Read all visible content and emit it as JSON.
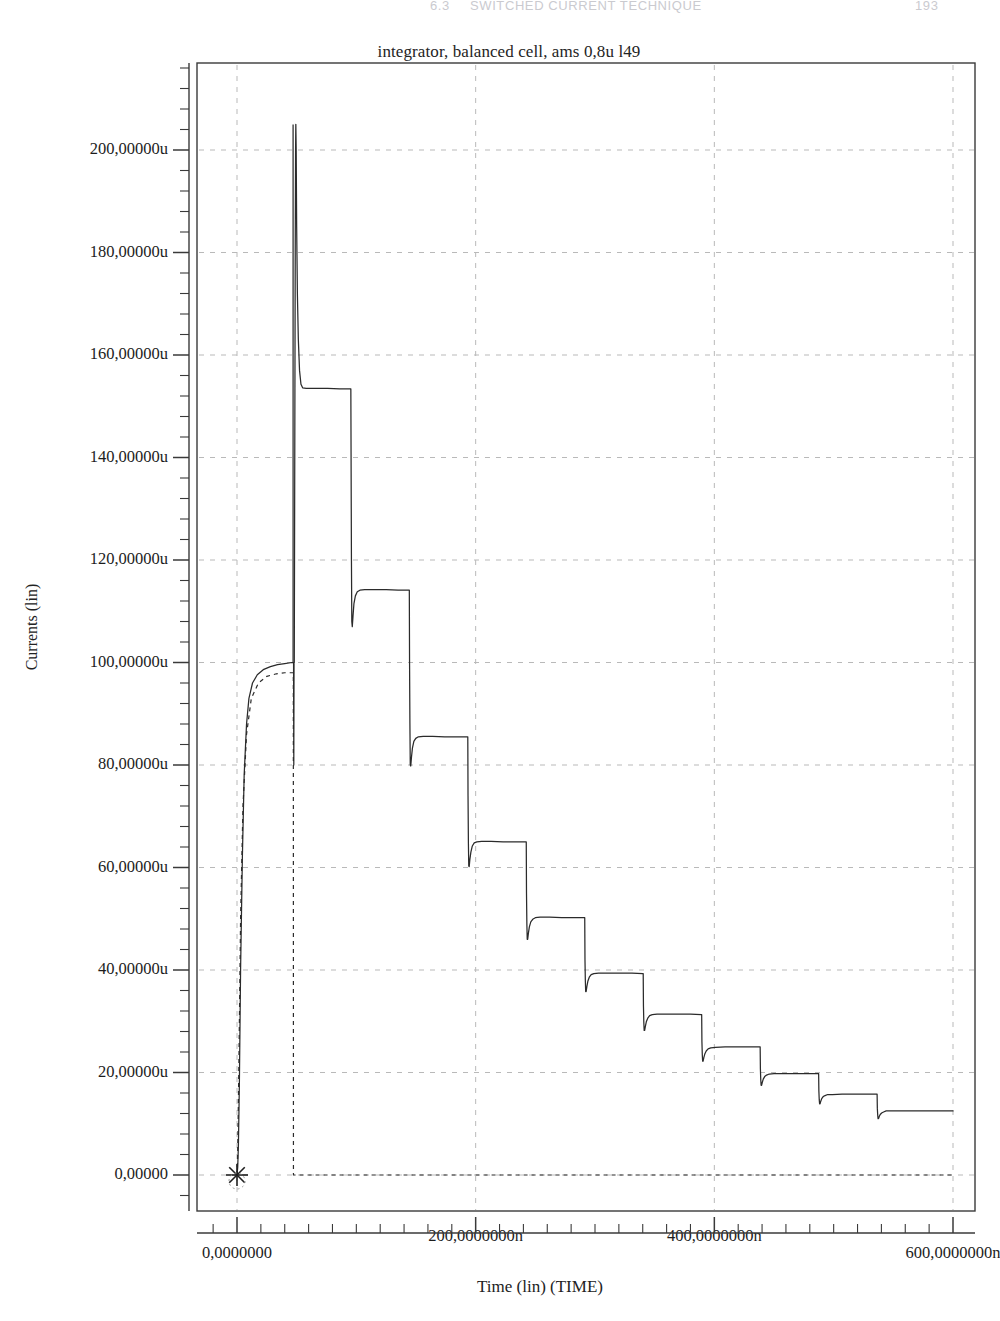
{
  "page_header": {
    "section": "6.3",
    "title": "SWITCHED CURRENT TECHNIQUE",
    "page_number": "193"
  },
  "chart_data": {
    "type": "line",
    "title": "integrator, balanced cell,  ams 0,8u l49",
    "xlabel": "Time (lin) (TIME)",
    "ylabel": "Currents (lin)",
    "xlim": [
      -18,
      640
    ],
    "ylim": [
      -12,
      228
    ],
    "x_unit": "n",
    "y_unit": "u",
    "grid": "dashed-major",
    "legend": "none",
    "x_ticks": [
      {
        "value": 0,
        "label": "0,0000000"
      },
      {
        "value": 200,
        "label": "200,0000000n"
      },
      {
        "value": 400,
        "label": "400,0000000n"
      },
      {
        "value": 600,
        "label": "600,0000000n"
      }
    ],
    "x_minor_step": 20,
    "y_ticks": [
      {
        "value": 0,
        "label": "0,00000"
      },
      {
        "value": 20,
        "label": "20,00000u"
      },
      {
        "value": 40,
        "label": "40,00000u"
      },
      {
        "value": 60,
        "label": "60,00000u"
      },
      {
        "value": 80,
        "label": "80,00000u"
      },
      {
        "value": 100,
        "label": "100,00000u"
      },
      {
        "value": 120,
        "label": "120,00000u"
      },
      {
        "value": 140,
        "label": "140,00000u"
      },
      {
        "value": 160,
        "label": "160,00000u"
      },
      {
        "value": 180,
        "label": "180,00000u"
      },
      {
        "value": 200,
        "label": "200,00000u"
      }
    ],
    "y_minor_step": 4,
    "origin_marker": {
      "x": 0,
      "y": 0,
      "symbol": "asterisk"
    },
    "series": [
      {
        "name": "current-solid",
        "style": "solid",
        "color": "#2b2b2b",
        "points": [
          [
            0,
            0
          ],
          [
            0.6,
            1.5
          ],
          [
            1.2,
            6
          ],
          [
            2,
            18
          ],
          [
            3,
            40
          ],
          [
            4.5,
            62
          ],
          [
            6,
            78
          ],
          [
            8,
            88
          ],
          [
            10,
            93
          ],
          [
            13,
            96
          ],
          [
            17,
            97.6
          ],
          [
            22,
            98.6
          ],
          [
            28,
            99.2
          ],
          [
            34,
            99.6
          ],
          [
            40,
            99.8
          ],
          [
            46,
            100
          ],
          [
            47,
            100
          ],
          [
            47.2,
            100
          ],
          [
            47.4,
            100
          ],
          [
            47.6,
            80
          ],
          [
            47.8,
            100
          ],
          [
            48,
            100
          ],
          [
            48.4,
            140
          ],
          [
            48.8,
            180
          ],
          [
            49.1,
            200
          ],
          [
            49.3,
            205
          ],
          [
            49.6,
            200
          ],
          [
            50,
            185
          ],
          [
            50.6,
            172
          ],
          [
            51.4,
            163
          ],
          [
            52.4,
            157
          ],
          [
            53.6,
            154.3
          ],
          [
            55,
            153.6
          ],
          [
            58,
            153.5
          ],
          [
            66,
            153.5
          ],
          [
            76,
            153.5
          ],
          [
            86,
            153.4
          ],
          [
            95,
            153.4
          ],
          [
            95.4,
            153.4
          ],
          [
            95.6,
            140
          ],
          [
            95.9,
            120
          ],
          [
            96.2,
            108
          ],
          [
            96.6,
            107
          ],
          [
            97.2,
            109
          ],
          [
            98,
            111.5
          ],
          [
            99.2,
            113
          ],
          [
            100.8,
            113.8
          ],
          [
            103,
            114.1
          ],
          [
            107,
            114.2
          ],
          [
            115,
            114.2
          ],
          [
            125,
            114.2
          ],
          [
            135,
            114.1
          ],
          [
            144,
            114.1
          ],
          [
            144.4,
            114.1
          ],
          [
            144.6,
            100
          ],
          [
            144.9,
            88
          ],
          [
            145.2,
            80
          ],
          [
            145.6,
            79.8
          ],
          [
            146.2,
            81.5
          ],
          [
            147,
            83.3
          ],
          [
            148.2,
            84.6
          ],
          [
            149.8,
            85.2
          ],
          [
            152,
            85.5
          ],
          [
            156,
            85.6
          ],
          [
            164,
            85.6
          ],
          [
            174,
            85.5
          ],
          [
            184,
            85.5
          ],
          [
            193,
            85.5
          ],
          [
            193.4,
            85.5
          ],
          [
            193.6,
            74
          ],
          [
            193.9,
            65
          ],
          [
            194.2,
            60.3
          ],
          [
            194.6,
            60.2
          ],
          [
            195.2,
            61.7
          ],
          [
            196,
            63
          ],
          [
            197.2,
            64.2
          ],
          [
            198.8,
            64.8
          ],
          [
            201,
            65
          ],
          [
            205,
            65.1
          ],
          [
            213,
            65.1
          ],
          [
            223,
            65
          ],
          [
            233,
            65
          ],
          [
            242,
            65
          ],
          [
            242.4,
            65
          ],
          [
            242.6,
            55
          ],
          [
            242.9,
            49
          ],
          [
            243.2,
            46
          ],
          [
            243.6,
            46
          ],
          [
            244.2,
            47.2
          ],
          [
            245,
            48.4
          ],
          [
            246.2,
            49.4
          ],
          [
            247.8,
            49.9
          ],
          [
            250,
            50.2
          ],
          [
            254,
            50.3
          ],
          [
            262,
            50.3
          ],
          [
            272,
            50.2
          ],
          [
            282,
            50.2
          ],
          [
            291,
            50.2
          ],
          [
            291.4,
            50.2
          ],
          [
            291.6,
            42
          ],
          [
            291.9,
            38
          ],
          [
            292.2,
            35.8
          ],
          [
            292.6,
            35.8
          ],
          [
            293.2,
            36.8
          ],
          [
            294,
            37.8
          ],
          [
            295.2,
            38.6
          ],
          [
            296.8,
            39.1
          ],
          [
            299,
            39.3
          ],
          [
            303,
            39.4
          ],
          [
            311,
            39.4
          ],
          [
            321,
            39.4
          ],
          [
            331,
            39.4
          ],
          [
            340,
            39.3
          ],
          [
            340.4,
            39.3
          ],
          [
            340.6,
            33
          ],
          [
            340.9,
            29.8
          ],
          [
            341.2,
            28.2
          ],
          [
            341.6,
            28.2
          ],
          [
            342.2,
            29
          ],
          [
            343,
            29.9
          ],
          [
            344.2,
            30.6
          ],
          [
            345.8,
            31.1
          ],
          [
            348,
            31.3
          ],
          [
            352,
            31.4
          ],
          [
            360,
            31.4
          ],
          [
            370,
            31.4
          ],
          [
            380,
            31.4
          ],
          [
            389,
            31.3
          ],
          [
            389.4,
            31.3
          ],
          [
            389.6,
            26
          ],
          [
            389.9,
            23.5
          ],
          [
            390.2,
            22.2
          ],
          [
            390.6,
            22.2
          ],
          [
            391.2,
            22.9
          ],
          [
            392,
            23.6
          ],
          [
            393.2,
            24.2
          ],
          [
            394.8,
            24.6
          ],
          [
            397,
            24.8
          ],
          [
            401,
            24.9
          ],
          [
            409,
            25
          ],
          [
            419,
            25
          ],
          [
            429,
            25
          ],
          [
            438,
            25
          ],
          [
            438.4,
            25
          ],
          [
            438.6,
            20.7
          ],
          [
            438.9,
            18.6
          ],
          [
            439.2,
            17.5
          ],
          [
            439.6,
            17.5
          ],
          [
            440.2,
            18.1
          ],
          [
            441,
            18.7
          ],
          [
            442.2,
            19.2
          ],
          [
            443.8,
            19.5
          ],
          [
            446,
            19.7
          ],
          [
            450,
            19.8
          ],
          [
            458,
            19.8
          ],
          [
            468,
            19.8
          ],
          [
            478,
            19.8
          ],
          [
            487,
            19.8
          ],
          [
            487.4,
            19.8
          ],
          [
            487.6,
            16.4
          ],
          [
            487.9,
            14.7
          ],
          [
            488.2,
            13.9
          ],
          [
            488.6,
            13.9
          ],
          [
            489.2,
            14.4
          ],
          [
            490,
            14.9
          ],
          [
            491.2,
            15.3
          ],
          [
            492.8,
            15.5
          ],
          [
            495,
            15.7
          ],
          [
            499,
            15.7
          ],
          [
            507,
            15.8
          ],
          [
            517,
            15.8
          ],
          [
            527,
            15.8
          ],
          [
            536,
            15.8
          ],
          [
            536.4,
            15.8
          ],
          [
            536.6,
            13
          ],
          [
            536.9,
            11.7
          ],
          [
            537.2,
            11
          ],
          [
            537.6,
            11
          ],
          [
            538.2,
            11.4
          ],
          [
            539,
            11.8
          ],
          [
            540.2,
            12.1
          ],
          [
            541.8,
            12.3
          ],
          [
            544,
            12.5
          ],
          [
            548,
            12.5
          ],
          [
            556,
            12.5
          ],
          [
            566,
            12.5
          ],
          [
            576,
            12.5
          ],
          [
            585,
            12.5
          ],
          [
            600,
            12.5
          ]
        ]
      },
      {
        "name": "current-peaks-upper",
        "style": "solid",
        "color": "#2b2b2b",
        "description": "vertical rise spikes at each step boundary"
      },
      {
        "name": "reference-dashed",
        "style": "dashed",
        "color": "#2b2b2b",
        "points": [
          [
            0,
            0
          ],
          [
            0.5,
            3
          ],
          [
            1.5,
            20
          ],
          [
            3,
            50
          ],
          [
            5,
            72
          ],
          [
            8,
            86
          ],
          [
            12,
            93
          ],
          [
            18,
            96
          ],
          [
            25,
            97.3
          ],
          [
            33,
            97.8
          ],
          [
            40,
            98
          ],
          [
            47,
            98
          ],
          [
            47.2,
            98
          ],
          [
            47.3,
            0
          ],
          [
            120,
            0
          ],
          [
            300,
            0
          ],
          [
            480,
            0
          ],
          [
            600,
            0
          ]
        ]
      }
    ],
    "steps": [
      {
        "plateau": 100.0,
        "t_start": 0,
        "t_end": 47
      },
      {
        "plateau": 153.5,
        "t_end": 95,
        "peak": 205.0,
        "dip": 80.0
      },
      {
        "plateau": 114.2,
        "t_end": 144,
        "peak": 153.5,
        "dip": 107.0
      },
      {
        "plateau": 85.6,
        "t_end": 193,
        "peak": 114.2,
        "dip": 79.8
      },
      {
        "plateau": 65.1,
        "t_end": 242,
        "peak": 85.6,
        "dip": 60.2
      },
      {
        "plateau": 50.3,
        "t_end": 291,
        "peak": 65.1,
        "dip": 46.0
      },
      {
        "plateau": 39.4,
        "t_end": 340,
        "peak": 50.3,
        "dip": 35.8
      },
      {
        "plateau": 31.4,
        "t_end": 389,
        "peak": 39.4,
        "dip": 28.2
      },
      {
        "plateau": 25.0,
        "t_end": 438,
        "peak": 31.4,
        "dip": 22.2
      },
      {
        "plateau": 19.8,
        "t_end": 487,
        "peak": 25.0,
        "dip": 17.5
      },
      {
        "plateau": 15.8,
        "t_end": 536,
        "peak": 19.8,
        "dip": 13.9
      },
      {
        "plateau": 12.5,
        "t_end": 600,
        "peak": 15.8,
        "dip": 11.0
      }
    ]
  }
}
